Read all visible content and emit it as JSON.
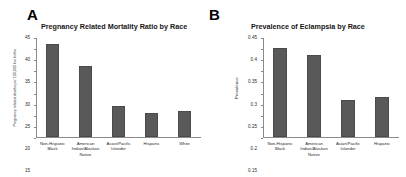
{
  "figure": {
    "panels": [
      {
        "letter": "A"
      },
      {
        "letter": "B"
      }
    ]
  },
  "chart_data": [
    {
      "type": "bar",
      "panel": "A",
      "title": "Pregnancy Related Mortality Ratio by Race",
      "xlabel": "",
      "ylabel": "Pregnancy related deaths per 100,000 live births",
      "categories": [
        "Non-Hispanic Black",
        "American Indian/Alaskan Native",
        "Asian/Pacific Islander",
        "Hispanic",
        "White"
      ],
      "values": [
        42,
        32,
        14,
        11,
        12
      ],
      "ylim": [
        0,
        45
      ],
      "yticks": [
        0,
        5,
        10,
        15,
        20,
        25,
        30,
        35,
        40,
        45
      ],
      "ytick_labels": [
        "0",
        "5",
        "10",
        "15",
        "20",
        "25",
        "30",
        "35",
        "40",
        "45"
      ],
      "grid": false,
      "legend": "none",
      "bar_color": "#595959"
    },
    {
      "type": "bar",
      "panel": "B",
      "title": "Prevalence of Eclampsia by Race",
      "xlabel": "",
      "ylabel": "Prevalence",
      "categories": [
        "Non-Hispanic Black",
        "American Indian/Alaskan Native",
        "Asian/Pacific Islander",
        "Hispanic"
      ],
      "values": [
        0.4,
        0.37,
        0.17,
        0.18
      ],
      "ylim": [
        0,
        0.45
      ],
      "yticks": [
        0,
        0.05,
        0.1,
        0.15,
        0.2,
        0.25,
        0.3,
        0.35,
        0.4,
        0.45
      ],
      "ytick_labels": [
        "0",
        "0.05",
        "0.1",
        "0.15",
        "0.2",
        "0.25",
        "0.3",
        "0.35",
        "0.4",
        "0.45"
      ],
      "grid": false,
      "legend": "none",
      "bar_color": "#595959"
    }
  ]
}
